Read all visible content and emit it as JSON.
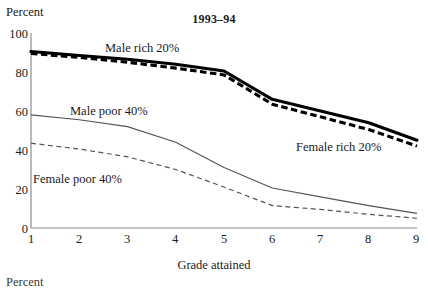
{
  "figure": {
    "title": "1993–94",
    "ylabel": "Percent",
    "xlabel": "Grade attained",
    "next_chart_partial_label": "Percent"
  },
  "axes": {
    "y_ticks": [
      "0",
      "20",
      "40",
      "60",
      "80",
      "100"
    ],
    "x_ticks": [
      "1",
      "2",
      "3",
      "4",
      "5",
      "6",
      "7",
      "8",
      "9"
    ]
  },
  "series_labels": {
    "male_rich": "Male rich 20%",
    "female_rich": "Female rich 20%",
    "male_poor": "Male poor 40%",
    "female_poor": "Female poor 40%"
  },
  "colors": {
    "thick_line": "#000000",
    "thin_line": "#555555",
    "axis": "#808080",
    "text": "#1a1a1a",
    "background": "#ffffff"
  },
  "chart_data": {
    "type": "line",
    "title": "1993–94",
    "xlabel": "Grade attained",
    "ylabel": "Percent",
    "xlim": [
      1,
      9
    ],
    "ylim": [
      0,
      100
    ],
    "x": [
      1,
      2,
      3,
      4,
      5,
      6,
      7,
      8,
      9
    ],
    "y_tick_values": [
      0,
      20,
      40,
      60,
      80,
      100
    ],
    "grid": false,
    "legend": "inline-annotations",
    "series": [
      {
        "name": "Male rich 20%",
        "style": "solid-thick",
        "values": [
          90.5,
          88.5,
          86.5,
          84.0,
          80.5,
          66.0,
          60.0,
          54.0,
          45.0
        ]
      },
      {
        "name": "Female rich 20%",
        "style": "dashed-thick",
        "values": [
          89.5,
          87.5,
          85.0,
          82.0,
          78.5,
          63.5,
          57.0,
          50.5,
          42.0
        ]
      },
      {
        "name": "Male poor 40%",
        "style": "solid-thin",
        "values": [
          58.0,
          55.5,
          52.0,
          44.0,
          31.0,
          20.5,
          16.0,
          11.5,
          7.5
        ]
      },
      {
        "name": "Female poor 40%",
        "style": "dashed-thin",
        "values": [
          43.5,
          40.5,
          36.5,
          30.0,
          21.0,
          11.5,
          9.5,
          7.0,
          5.0
        ]
      }
    ]
  }
}
